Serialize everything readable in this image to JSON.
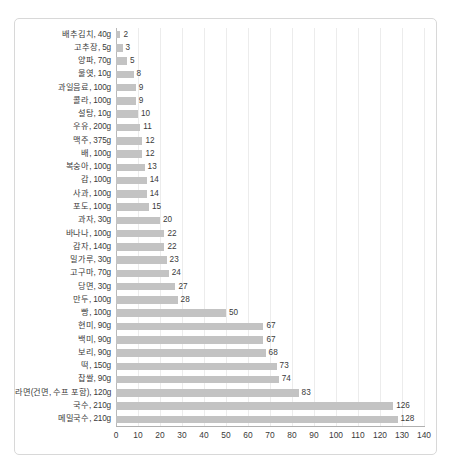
{
  "chart_data": {
    "type": "bar",
    "orientation": "horizontal",
    "title": "",
    "subtitle": "",
    "xlabel": "",
    "ylabel": "",
    "xlim": [
      0,
      140
    ],
    "xticks": [
      0,
      10,
      20,
      30,
      40,
      50,
      60,
      70,
      80,
      90,
      100,
      110,
      120,
      130,
      140
    ],
    "grid": true,
    "legend": false,
    "bar_color": "#c3c3c3",
    "gridline_color": "#ececec",
    "axis_color": "#b0b0b0",
    "text_color": "#3a3a3a",
    "show_value_labels": true,
    "categories": [
      "배추김치, 40g",
      "고추장, 5g",
      "양파, 70g",
      "물엿, 10g",
      "과일음료, 100g",
      "콜라, 100g",
      "설탕, 10g",
      "우유, 200g",
      "맥주, 375g",
      "배, 100g",
      "복숭아, 100g",
      "감, 100g",
      "사과, 100g",
      "포도, 100g",
      "과자, 30g",
      "바나나, 100g",
      "감자, 140g",
      "밀가루, 30g",
      "고구마, 70g",
      "당면, 30g",
      "만두, 100g",
      "빵, 100g",
      "현미, 90g",
      "백미, 90g",
      "보리, 90g",
      "떡, 150g",
      "찹쌀, 90g",
      "라면(건면, 수프 포함), 120g",
      "국수, 210g",
      "메밀국수, 210g"
    ],
    "values": [
      2,
      3,
      5,
      8,
      9,
      9,
      10,
      11,
      12,
      12,
      13,
      14,
      14,
      15,
      20,
      22,
      22,
      23,
      24,
      27,
      28,
      50,
      67,
      67,
      68,
      73,
      74,
      83,
      126,
      128
    ]
  }
}
